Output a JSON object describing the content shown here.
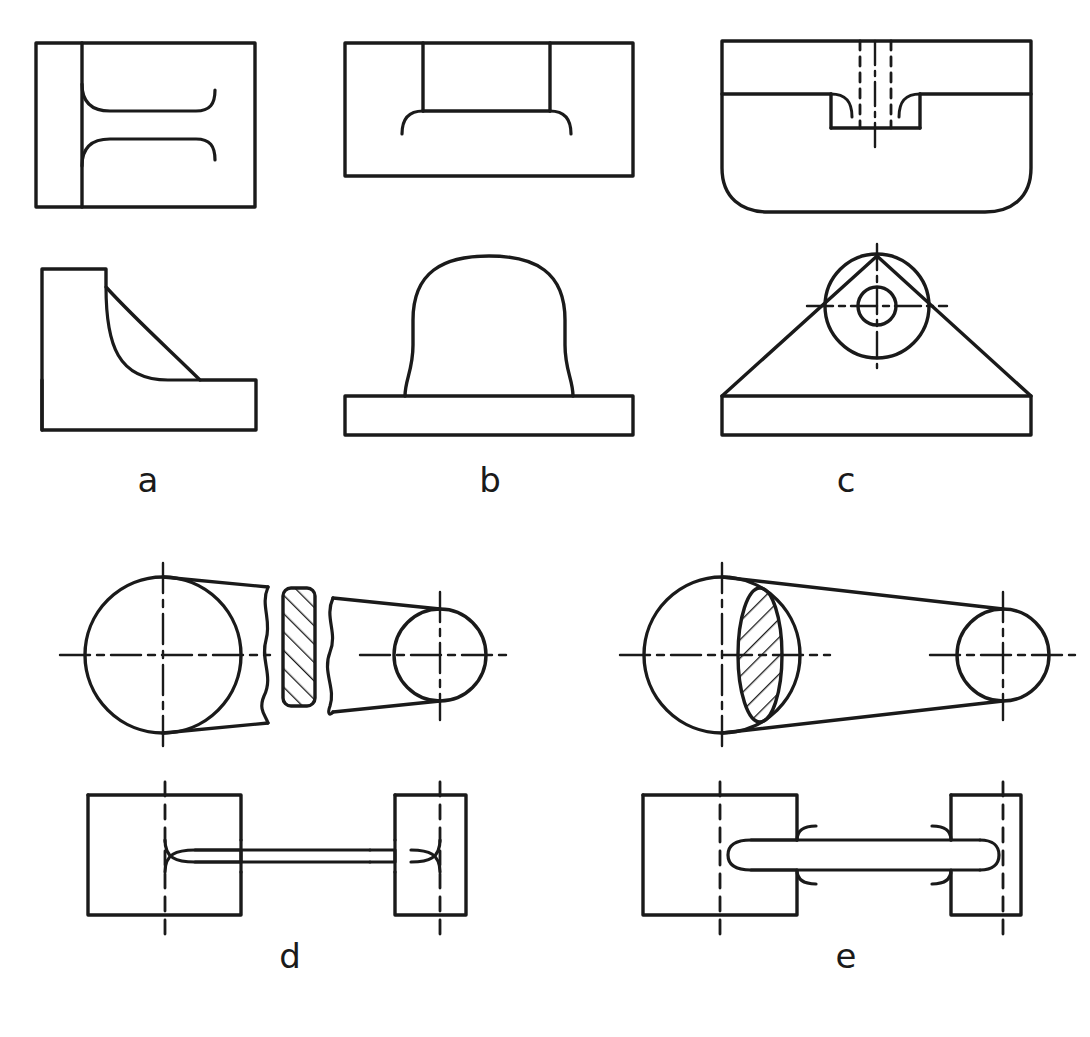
{
  "plate": {
    "title": "Engineering drawing plate — sectional and conventional representations",
    "background_color": "#ffffff",
    "line_color": "#1a1a1a",
    "width": 1090,
    "height": 1037
  },
  "figures": [
    {
      "id": "a",
      "label": "a",
      "label_x": 148,
      "label_y": 492,
      "caption": "Bracket with filleted web — top view and front view",
      "views": [
        "top-view-rectangle-with-fillet-runouts",
        "front-view-angled-bracket"
      ]
    },
    {
      "id": "b",
      "label": "b",
      "label_x": 490,
      "label_y": 492,
      "caption": "Rounded boss on base plate — top view and front view",
      "views": [
        "top-view-rectangle-with-slot",
        "front-view-dome-on-base"
      ]
    },
    {
      "id": "c",
      "label": "c",
      "label_x": 846,
      "label_y": 492,
      "caption": "Triangular base with counterbored hole — top view and front view",
      "views": [
        "top-view-with-counterbore-hidden-lines",
        "front-view-triangle-with-circles"
      ]
    },
    {
      "id": "d",
      "label": "d",
      "label_x": 290,
      "label_y": 968,
      "caption": "Tapered shaft with conventional break and removed section",
      "views": [
        "top-view-broken-taper-with-removed-section",
        "front-view-necked-shaft"
      ]
    },
    {
      "id": "e",
      "label": "e",
      "label_x": 846,
      "label_y": 968,
      "caption": "Tapered shaft with revolved section superimposed on view",
      "views": [
        "top-view-taper-with-revolved-section",
        "front-view-necked-shaft"
      ]
    }
  ],
  "line_styles": {
    "visible_label": "continuous thick",
    "hidden_label": "dashed thin",
    "center_label": "chain dash-dot thin",
    "hatch_label": "section hatching 45 degrees",
    "break_label": "freehand break line"
  },
  "labels": {
    "a": "a",
    "b": "b",
    "c": "c",
    "d": "d",
    "e": "e"
  }
}
